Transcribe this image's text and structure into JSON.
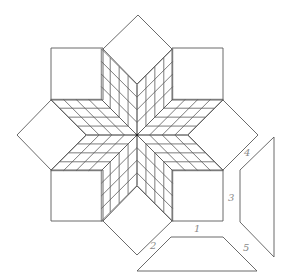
{
  "diagram": {
    "stroke_color": "#5a5a5a",
    "label_color": "#8a8a8a",
    "center": [
      137,
      135
    ],
    "notch_radius": 50.5,
    "grid_divisions": 4,
    "star_arms": 8,
    "setting_squares": [
      {
        "name": "top-left-square",
        "points": [
          [
            51,
            48
          ],
          [
            103,
            48
          ],
          [
            103,
            100
          ],
          [
            51,
            100
          ]
        ]
      },
      {
        "name": "top-right-square",
        "points": [
          [
            172,
            48
          ],
          [
            223,
            48
          ],
          [
            223,
            100
          ],
          [
            172,
            100
          ]
        ]
      },
      {
        "name": "bottom-left-square",
        "points": [
          [
            51,
            170
          ],
          [
            103,
            170
          ],
          [
            103,
            221
          ],
          [
            51,
            221
          ]
        ]
      },
      {
        "name": "bottom-right-square",
        "points": [
          [
            172,
            170
          ],
          [
            223,
            170
          ],
          [
            223,
            221
          ],
          [
            172,
            221
          ]
        ]
      }
    ],
    "setting_triangles": [
      {
        "name": "top-diamond",
        "points": [
          [
            103,
            49
          ],
          [
            138,
            15
          ],
          [
            172,
            49
          ],
          [
            137,
            84
          ]
        ]
      },
      {
        "name": "right-diamond",
        "points": [
          [
            223,
            100
          ],
          [
            258,
            135
          ],
          [
            223,
            170
          ],
          [
            188,
            135
          ]
        ]
      },
      {
        "name": "bottom-diamond",
        "points": [
          [
            172,
            221
          ],
          [
            137,
            255
          ],
          [
            103,
            221
          ],
          [
            137,
            186
          ]
        ]
      },
      {
        "name": "left-diamond",
        "points": [
          [
            51,
            170
          ],
          [
            17,
            135
          ],
          [
            51,
            100
          ],
          [
            86,
            135
          ]
        ]
      }
    ],
    "template_pieces": [
      {
        "name": "trapezoid-piece-bottom",
        "points": [
          [
            171,
            237
          ],
          [
            223,
            237
          ],
          [
            257,
            271
          ],
          [
            137,
            271
          ]
        ]
      },
      {
        "name": "trapezoid-piece-right",
        "points": [
          [
            274,
            137
          ],
          [
            274,
            257
          ],
          [
            240,
            222
          ],
          [
            240,
            170
          ]
        ]
      }
    ],
    "labels": [
      {
        "name": "label-1",
        "text": "1",
        "x": 194,
        "y": 232
      },
      {
        "name": "label-2",
        "text": "2",
        "x": 150,
        "y": 249
      },
      {
        "name": "label-3",
        "text": "3",
        "x": 228,
        "y": 201
      },
      {
        "name": "label-4",
        "text": "4",
        "x": 244,
        "y": 156
      },
      {
        "name": "label-5",
        "text": "5",
        "x": 243,
        "y": 251
      }
    ]
  }
}
